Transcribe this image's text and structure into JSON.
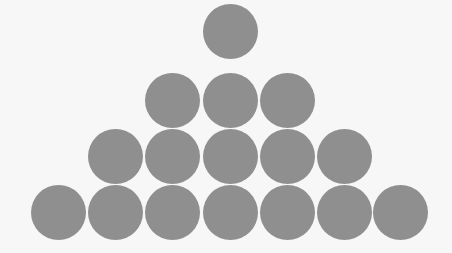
{
  "figure": {
    "background_color": "#f7f7f7",
    "circle_color": "#8f8f8f",
    "circle_diameter": 55,
    "rows": [
      {
        "count": 1,
        "center_y": 31,
        "centers_x": [
          230
        ]
      },
      {
        "count": 3,
        "center_y": 100,
        "centers_x": [
          172,
          230,
          287
        ]
      },
      {
        "count": 5,
        "center_y": 156,
        "centers_x": [
          115,
          172,
          230,
          287,
          344
        ]
      },
      {
        "count": 7,
        "center_y": 212,
        "centers_x": [
          58,
          115,
          172,
          230,
          287,
          344,
          400
        ]
      }
    ],
    "total_circles": 16
  }
}
